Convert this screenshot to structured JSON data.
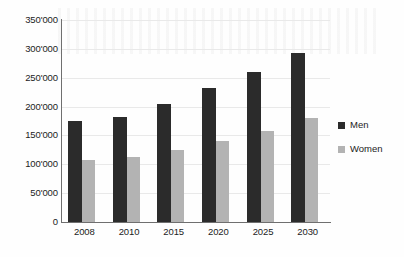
{
  "chart_data": {
    "type": "bar",
    "title": "",
    "xlabel": "",
    "ylabel": "",
    "categories": [
      "2008",
      "2010",
      "2015",
      "2020",
      "2025",
      "2030"
    ],
    "series": [
      {
        "name": "Men",
        "color": "#2b2b2b",
        "values": [
          175000,
          182000,
          205000,
          232000,
          260000,
          292000
        ]
      },
      {
        "name": "Women",
        "color": "#b3b3b3",
        "values": [
          107000,
          112000,
          125000,
          140000,
          158000,
          180000
        ]
      }
    ],
    "ylim": [
      0,
      350000
    ],
    "ytick_values": [
      0,
      50000,
      100000,
      150000,
      200000,
      250000,
      300000,
      350000
    ],
    "ytick_labels": [
      "0",
      "50'000",
      "100'000",
      "150'000",
      "200'000",
      "250'000",
      "300'000",
      "350'000"
    ],
    "grid": true,
    "legend_position": "right"
  },
  "legend": {
    "items": [
      {
        "label": "Men",
        "swatch": "men-swatch"
      },
      {
        "label": "Women",
        "swatch": "women-swatch"
      }
    ]
  }
}
